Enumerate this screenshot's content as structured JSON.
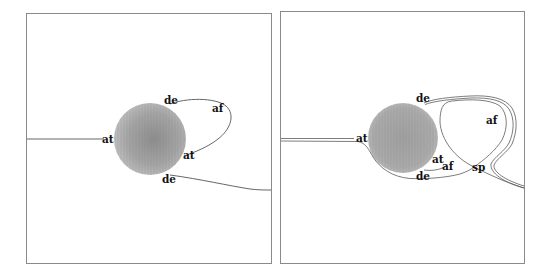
{
  "panels": [
    {
      "id": "left",
      "frame": {
        "x": 26,
        "y": 13,
        "w": 245,
        "h": 250
      },
      "sphere": {
        "cx": 150,
        "cy": 139,
        "r": 36
      },
      "labels": [
        {
          "text": "de",
          "x": 164,
          "y": 104
        },
        {
          "text": "af",
          "x": 212,
          "y": 112
        },
        {
          "text": "at",
          "x": 102,
          "y": 143
        },
        {
          "text": "at",
          "x": 183,
          "y": 159
        },
        {
          "text": "de",
          "x": 162,
          "y": 183
        }
      ]
    },
    {
      "id": "right",
      "frame": {
        "x": 280,
        "y": 11,
        "w": 244,
        "h": 252
      },
      "sphere": {
        "cx": 403,
        "cy": 138,
        "r": 35
      },
      "labels": [
        {
          "text": "de",
          "x": 416,
          "y": 102
        },
        {
          "text": "af",
          "x": 486,
          "y": 124
        },
        {
          "text": "at",
          "x": 356,
          "y": 142
        },
        {
          "text": "at",
          "x": 432,
          "y": 163
        },
        {
          "text": "af",
          "x": 442,
          "y": 170
        },
        {
          "text": "de",
          "x": 416,
          "y": 180
        },
        {
          "text": "sp",
          "x": 472,
          "y": 171
        }
      ]
    }
  ],
  "colors": {
    "background": "#ffffff",
    "frame": "#8a8a8a",
    "sphere_light": "#b9b9b9",
    "sphere_dark": "#8f8f8f",
    "streamline": "#555555",
    "label": "#111111"
  }
}
